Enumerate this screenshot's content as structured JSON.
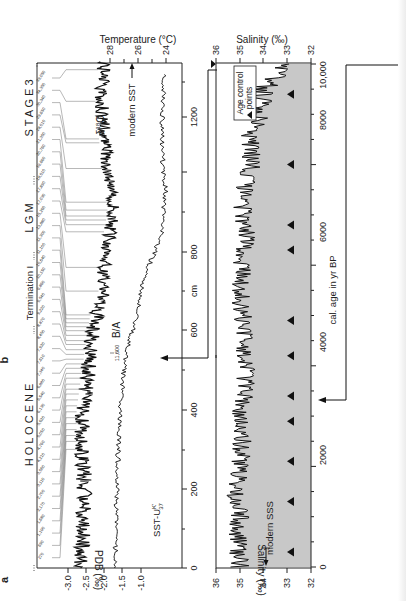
{
  "figure": {
    "panel_a_label": "a",
    "panel_b_label": "b",
    "orientation": "rotated -90deg (x axes run bottom-to-top)"
  },
  "panel_a": {
    "stage_labels": [
      "H O L O C E N E",
      "Termination I",
      "L G M",
      "S T A G E  3"
    ],
    "depth_axis": {
      "label": "cm",
      "ticks": [
        "0",
        "200",
        "400",
        "600",
        "800",
        "1200"
      ]
    },
    "pdb_axis": {
      "label": "PDB (‰)",
      "ticks": [
        "-3.0",
        "-2.5",
        "-2.0",
        "-1.5",
        "-1.0"
      ]
    },
    "temp_axis": {
      "label": "Temperature (°C)",
      "ticks": [
        "28",
        "26",
        "24"
      ]
    },
    "curve_labels": {
      "d18o": "δ18O",
      "sst": "SST-U",
      "sst_sup": "K'",
      "sst_sub": "37",
      "modern_sst": "modern SST",
      "ba": "B/A",
      "age_11600": "11,600"
    },
    "age_tie_points": [
      "39,050",
      "34,350",
      "30,340",
      "29,650",
      "28,010",
      "21,350",
      "20,760",
      "19,660",
      "18,510",
      "17,890",
      "17,030",
      "15,260",
      "13,880",
      "11,300",
      "11,100",
      "10,640",
      "10,150",
      "9,860",
      "9,540",
      "9,220",
      "8,870",
      "8,450",
      "7,920",
      "7,610",
      "7,340",
      "6,880",
      "6,540",
      "6,130",
      "5,620",
      "5,050",
      "4,760",
      "4,210",
      "3,560",
      "3,110",
      "2,700",
      "2,170",
      "1,680",
      "1,190",
      "690",
      "270"
    ]
  },
  "panel_b": {
    "salinity_axis": {
      "label": "Salinity (‰)",
      "ticks": [
        "36",
        "35",
        "34",
        "33",
        "32"
      ]
    },
    "age_axis": {
      "label": "cal. age in yr BP",
      "ticks": [
        "0",
        "2000",
        "4000",
        "6000",
        "8000",
        "10,000"
      ]
    },
    "legend": {
      "marker": "▲",
      "text_line1": "Age control",
      "text_line2": "points"
    },
    "modern_sss": "modern SSS",
    "fill_color": "#c8c8c8"
  },
  "chart_data": [
    {
      "type": "line",
      "title": "Panel a: δ18O and alkenone SST vs depth",
      "xlabel": "cm",
      "ylabel": "PDB (‰) / Temperature (°C)",
      "xlim": [
        0,
        1300
      ],
      "x_ticks": [
        0,
        200,
        400,
        600,
        800,
        1200
      ],
      "y_left_ticks": [
        -3.0,
        -2.5,
        -2.0,
        -1.5,
        -1.0
      ],
      "y_right_ticks": [
        28,
        26,
        24
      ],
      "series": [
        {
          "name": "δ18O (‰ PDB)",
          "x": [
            0,
            100,
            200,
            300,
            400,
            500,
            600,
            650,
            700,
            750,
            800,
            850,
            900,
            950,
            1000,
            1050,
            1100,
            1150,
            1200,
            1250,
            1300
          ],
          "values": [
            -2.65,
            -2.6,
            -2.55,
            -2.6,
            -2.6,
            -2.45,
            -2.3,
            -2.2,
            -2.0,
            -2.05,
            -1.9,
            -1.85,
            -1.75,
            -1.8,
            -1.9,
            -1.95,
            -2.0,
            -2.05,
            -2.1,
            -2.0,
            -2.1
          ]
        },
        {
          "name": "SST-U K'37 (°C)",
          "x": [
            0,
            100,
            200,
            300,
            400,
            500,
            550,
            600,
            650,
            700,
            750,
            800,
            850,
            900,
            950,
            1000,
            1100,
            1200,
            1300
          ],
          "values": [
            27.6,
            27.6,
            27.5,
            27.4,
            27.3,
            27.0,
            26.8,
            26.4,
            26.0,
            25.8,
            25.4,
            24.8,
            24.3,
            24.2,
            24.0,
            24.2,
            24.3,
            24.2,
            24.0
          ]
        }
      ],
      "annotations": [
        "modern SST",
        "B/A",
        "11,600",
        "HOLOCENE",
        "Termination I",
        "LGM",
        "STAGE 3"
      ]
    },
    {
      "type": "area",
      "title": "Panel b: Sea surface salinity vs calendar age",
      "xlabel": "cal. age in yr BP",
      "ylabel": "Salinity (‰)",
      "xlim": [
        0,
        10000
      ],
      "ylim": [
        32,
        36
      ],
      "x_ticks": [
        0,
        2000,
        4000,
        6000,
        8000,
        10000
      ],
      "y_ticks": [
        36,
        35,
        34,
        33,
        32
      ],
      "series": [
        {
          "name": "SSS",
          "x": [
            0,
            500,
            1000,
            1500,
            2000,
            2500,
            3000,
            3500,
            4000,
            4500,
            5000,
            5500,
            6000,
            6500,
            7000,
            7500,
            8000,
            8500,
            9000,
            9500,
            10000
          ],
          "values": [
            35.0,
            35.1,
            35.0,
            35.2,
            35.0,
            34.9,
            35.0,
            34.8,
            34.7,
            34.8,
            34.9,
            35.0,
            34.9,
            34.7,
            34.9,
            34.8,
            34.5,
            34.6,
            34.2,
            34.0,
            33.0
          ]
        }
      ],
      "age_control_points": [
        300,
        1300,
        2100,
        2900,
        3400,
        4200,
        4900,
        6300,
        6800,
        8000,
        9400
      ],
      "annotations": [
        "modern SSS (~33.8 ‰)",
        "Age control points"
      ]
    }
  ]
}
